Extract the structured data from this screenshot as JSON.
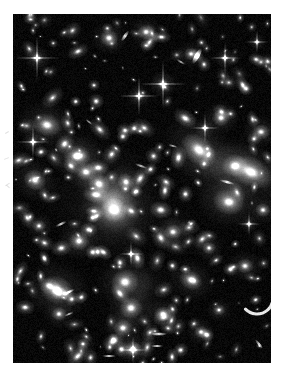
{
  "page": {
    "width": 283,
    "height": 379,
    "background_color": "#ffffff"
  },
  "image_frame": {
    "x": 13,
    "y": 14,
    "width": 258,
    "height": 349,
    "sky_color": "#000000",
    "object_color": "#ffffff",
    "border": "none",
    "caption": "",
    "labels": []
  },
  "margin_marks": {
    "description": "four faint grey pencil/scan tick marks in the left white margin",
    "color": "#c9c9c9",
    "count": 4
  },
  "chart_data": {
    "type": "scatter",
    "xlabel": "",
    "ylabel": "",
    "xlim": [
      0,
      258
    ],
    "ylim": [
      0,
      349
    ],
    "grid": false,
    "legend": "none",
    "series": [
      {
        "name": "diffuse cluster halo",
        "kind": "halo",
        "points": [
          {
            "x": 97,
            "y": 188,
            "r": 62,
            "b": 0.3
          },
          {
            "x": 104,
            "y": 196,
            "r": 40,
            "b": 0.42
          },
          {
            "x": 100,
            "y": 186,
            "r": 24,
            "b": 0.55
          },
          {
            "x": 196,
            "y": 150,
            "r": 36,
            "b": 0.2
          },
          {
            "x": 214,
            "y": 176,
            "r": 30,
            "b": 0.18
          },
          {
            "x": 132,
            "y": 272,
            "r": 32,
            "b": 0.16
          },
          {
            "x": 64,
            "y": 140,
            "r": 28,
            "b": 0.14
          },
          {
            "x": 160,
            "y": 215,
            "r": 26,
            "b": 0.13
          }
        ]
      },
      {
        "name": "bright foreground stars with diffraction spikes",
        "kind": "star",
        "points": [
          {
            "x": 24,
            "y": 44,
            "r": 4.0,
            "b": 1.0,
            "spike": 22
          },
          {
            "x": 126,
            "y": 82,
            "r": 3.6,
            "b": 1.0,
            "spike": 20
          },
          {
            "x": 150,
            "y": 70,
            "r": 4.2,
            "b": 1.0,
            "spike": 24
          },
          {
            "x": 212,
            "y": 44,
            "r": 3.2,
            "b": 0.95,
            "spike": 16
          },
          {
            "x": 20,
            "y": 128,
            "r": 3.4,
            "b": 0.95,
            "spike": 17
          },
          {
            "x": 192,
            "y": 114,
            "r": 3.2,
            "b": 0.92,
            "spike": 15
          },
          {
            "x": 244,
            "y": 28,
            "r": 2.6,
            "b": 0.85,
            "spike": 12
          },
          {
            "x": 118,
            "y": 240,
            "r": 3.0,
            "b": 0.9,
            "spike": 13
          },
          {
            "x": 236,
            "y": 210,
            "r": 2.8,
            "b": 0.88,
            "spike": 12
          },
          {
            "x": 120,
            "y": 336,
            "r": 3.4,
            "b": 0.95,
            "spike": 14
          }
        ]
      },
      {
        "name": "bright elliptical galaxies",
        "kind": "elliptical",
        "points": [
          {
            "x": 101,
            "y": 196,
            "r": 9.5,
            "b": 1.0,
            "e": 1.1,
            "a": 20
          },
          {
            "x": 86,
            "y": 170,
            "r": 8.0,
            "b": 0.96,
            "e": 1.15,
            "a": 35
          },
          {
            "x": 73,
            "y": 158,
            "r": 7.0,
            "b": 0.92,
            "e": 1.2,
            "a": 10
          },
          {
            "x": 113,
            "y": 168,
            "r": 6.5,
            "b": 0.9,
            "e": 1.1,
            "a": 60
          },
          {
            "x": 64,
            "y": 142,
            "r": 8.5,
            "b": 0.94,
            "e": 1.25,
            "a": 0
          },
          {
            "x": 34,
            "y": 111,
            "r": 9.0,
            "b": 0.93,
            "e": 1.3,
            "a": 15
          },
          {
            "x": 22,
            "y": 166,
            "r": 8.0,
            "b": 0.92,
            "e": 1.15,
            "a": 30
          },
          {
            "x": 186,
            "y": 136,
            "r": 11.0,
            "b": 0.97,
            "e": 1.45,
            "a": 40
          },
          {
            "x": 222,
            "y": 152,
            "r": 9.0,
            "b": 0.93,
            "e": 1.2,
            "a": 0
          },
          {
            "x": 238,
            "y": 158,
            "r": 11.5,
            "b": 0.98,
            "e": 1.6,
            "a": 25
          },
          {
            "x": 216,
            "y": 188,
            "r": 10.0,
            "b": 0.95,
            "e": 1.25,
            "a": 10
          },
          {
            "x": 208,
            "y": 104,
            "r": 6.5,
            "b": 0.88,
            "e": 1.1,
            "a": 0
          },
          {
            "x": 232,
            "y": 252,
            "r": 6.0,
            "b": 0.86,
            "e": 1.15,
            "a": 0
          },
          {
            "x": 44,
            "y": 276,
            "r": 11.0,
            "b": 0.95,
            "e": 1.2,
            "a": 20
          },
          {
            "x": 112,
            "y": 268,
            "r": 10.0,
            "b": 0.97,
            "e": 1.1,
            "a": 0
          },
          {
            "x": 118,
            "y": 294,
            "r": 8.5,
            "b": 0.94,
            "e": 1.1,
            "a": 0
          },
          {
            "x": 110,
            "y": 314,
            "r": 7.0,
            "b": 0.9,
            "e": 1.1,
            "a": 0
          },
          {
            "x": 150,
            "y": 300,
            "r": 6.0,
            "b": 0.88,
            "e": 1.2,
            "a": 0
          },
          {
            "x": 46,
            "y": 300,
            "r": 5.5,
            "b": 0.86,
            "e": 1.1,
            "a": 0
          },
          {
            "x": 66,
            "y": 227,
            "r": 7.5,
            "b": 0.92,
            "e": 1.1,
            "a": 0
          },
          {
            "x": 160,
            "y": 218,
            "r": 6.0,
            "b": 0.88,
            "e": 1.15,
            "a": 0
          },
          {
            "x": 178,
            "y": 266,
            "r": 7.5,
            "b": 0.9,
            "e": 1.25,
            "a": 30
          },
          {
            "x": 120,
            "y": 335,
            "r": 6.0,
            "b": 0.92,
            "e": 1.1,
            "a": 0
          },
          {
            "x": 188,
            "y": 318,
            "r": 5.0,
            "b": 0.84,
            "e": 1.1,
            "a": 0
          },
          {
            "x": 96,
            "y": 24,
            "r": 6.5,
            "b": 0.92,
            "e": 1.1,
            "a": 0
          },
          {
            "x": 133,
            "y": 18,
            "r": 6.0,
            "b": 0.9,
            "e": 1.1,
            "a": 0
          },
          {
            "x": 178,
            "y": 40,
            "r": 5.0,
            "b": 0.86,
            "e": 1.1,
            "a": 0
          },
          {
            "x": 248,
            "y": 118,
            "r": 6.0,
            "b": 0.88,
            "e": 1.2,
            "a": 0
          },
          {
            "x": 250,
            "y": 196,
            "r": 5.5,
            "b": 0.86,
            "e": 1.1,
            "a": 0
          },
          {
            "x": 196,
            "y": 234,
            "r": 5.0,
            "b": 0.84,
            "e": 1.1,
            "a": 0
          },
          {
            "x": 26,
            "y": 212,
            "r": 5.0,
            "b": 0.84,
            "e": 1.1,
            "a": 0
          },
          {
            "x": 70,
            "y": 330,
            "r": 4.5,
            "b": 0.82,
            "e": 1.1,
            "a": 0
          },
          {
            "x": 206,
            "y": 296,
            "r": 4.5,
            "b": 0.82,
            "e": 1.1,
            "a": 0
          }
        ]
      },
      {
        "name": "edge-on and lensed-arc galaxies",
        "kind": "streak",
        "points": [
          {
            "x": 146,
            "y": 320,
            "len": 16,
            "w": 2.5,
            "b": 0.85,
            "a": 0
          },
          {
            "x": 144,
            "y": 332,
            "len": 12,
            "w": 2.2,
            "b": 0.8,
            "a": 0
          },
          {
            "x": 96,
            "y": 342,
            "len": 14,
            "w": 2.2,
            "b": 0.78,
            "a": 0
          },
          {
            "x": 56,
            "y": 278,
            "len": 13,
            "w": 2.2,
            "b": 0.82,
            "a": -25
          },
          {
            "x": 48,
            "y": 210,
            "len": 12,
            "w": 2.2,
            "b": 0.82,
            "a": -25
          },
          {
            "x": 112,
            "y": 22,
            "len": 13,
            "w": 3.0,
            "b": 0.86,
            "a": -55
          },
          {
            "x": 184,
            "y": 42,
            "len": 18,
            "w": 4.5,
            "b": 0.88,
            "a": -60
          },
          {
            "x": 128,
            "y": 152,
            "len": 14,
            "w": 2.0,
            "b": 0.72,
            "a": 20
          },
          {
            "x": 214,
            "y": 168,
            "len": 16,
            "w": 2.4,
            "b": 0.8,
            "a": 15
          },
          {
            "x": 168,
            "y": 48,
            "len": 10,
            "w": 1.8,
            "b": 0.7,
            "a": 30
          },
          {
            "x": 56,
            "y": 300,
            "len": 10,
            "w": 1.8,
            "b": 0.7,
            "a": -25
          },
          {
            "x": 244,
            "y": 284,
            "len": 16,
            "w": 3.0,
            "b": 0.88,
            "a": 70,
            "arc": true
          },
          {
            "x": 246,
            "y": 330,
            "len": 12,
            "w": 2.0,
            "b": 0.78,
            "a": 50
          },
          {
            "x": 76,
            "y": 108,
            "len": 9,
            "w": 1.6,
            "b": 0.68,
            "a": 40
          },
          {
            "x": 160,
            "y": 132,
            "len": 10,
            "w": 1.8,
            "b": 0.7,
            "a": 15
          }
        ]
      },
      {
        "name": "faint field galaxies and stars",
        "kind": "point",
        "count": 260,
        "radius_range": [
          0.7,
          3.2
        ],
        "brightness_range": [
          0.25,
          0.85
        ]
      }
    ]
  }
}
